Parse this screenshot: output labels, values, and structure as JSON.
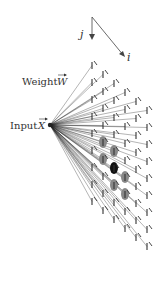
{
  "labels": {
    "axis_j": "j",
    "axis_i": "i",
    "weight": "Weight",
    "weight_symbol": "W",
    "input": "Input",
    "input_symbol": "X"
  },
  "colors": {
    "line": "#222222",
    "dash": "#333333",
    "winner": "#111111",
    "neighbor": "#888888",
    "text": "#333333"
  },
  "lattice": {
    "columns": 6,
    "rows": 9,
    "origin": [
      92,
      62
    ],
    "col_step": [
      11,
      9
    ],
    "row_step": [
      0,
      17
    ],
    "dash_length": 7,
    "winner": [
      2,
      5
    ],
    "neighbors": [
      [
        2,
        4
      ],
      [
        1,
        5
      ],
      [
        3,
        5
      ],
      [
        2,
        6
      ],
      [
        1,
        4
      ],
      [
        3,
        6
      ]
    ]
  },
  "input_point": [
    50,
    125
  ]
}
